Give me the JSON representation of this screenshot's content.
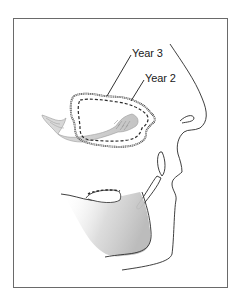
{
  "figure": {
    "labels": {
      "year3": "Year 3",
      "year2": "Year 2"
    },
    "colors": {
      "frame": "#6a6a6a",
      "outline": "#2a2a2a",
      "shading": "#bdbdbd",
      "bone_fill": "#c8c8c8",
      "label_text": "#1a1a1a"
    }
  }
}
